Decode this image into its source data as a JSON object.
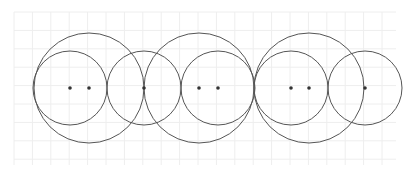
{
  "diagram": {
    "background": "#ffffff",
    "grid": {
      "x_start": 14,
      "x_end": 396,
      "y_start": 12,
      "y_end": 165,
      "spacing": 18.4,
      "color": "#eeeeee"
    },
    "stroke_color": "#555555",
    "point_color": "#333333",
    "circles": [
      {
        "cx": 89,
        "cy": 88,
        "r": 55
      },
      {
        "cx": 70,
        "cy": 88,
        "r": 37
      },
      {
        "cx": 144,
        "cy": 88,
        "r": 37
      },
      {
        "cx": 199,
        "cy": 88,
        "r": 55
      },
      {
        "cx": 218,
        "cy": 88,
        "r": 37
      },
      {
        "cx": 309,
        "cy": 88,
        "r": 55
      },
      {
        "cx": 291,
        "cy": 88,
        "r": 37
      },
      {
        "cx": 365,
        "cy": 88,
        "r": 37
      }
    ],
    "points": [
      {
        "x": 70,
        "y": 88
      },
      {
        "x": 89,
        "y": 88
      },
      {
        "x": 144,
        "y": 88
      },
      {
        "x": 199,
        "y": 88
      },
      {
        "x": 218,
        "y": 88
      },
      {
        "x": 291,
        "y": 88
      },
      {
        "x": 309,
        "y": 88
      },
      {
        "x": 365,
        "y": 88
      }
    ]
  }
}
